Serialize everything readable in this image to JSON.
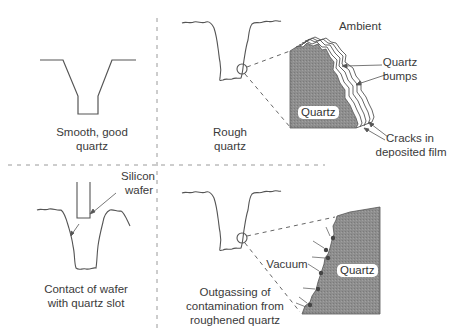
{
  "figure": {
    "panels": [
      {
        "id": "smooth",
        "caption_line1": "Smooth, good",
        "caption_line2": "quartz"
      },
      {
        "id": "rough",
        "caption_line1": "Rough",
        "caption_line2": "quartz",
        "detail": {
          "ambient_label": "Ambient",
          "bumps_label_line1": "Quartz",
          "bumps_label_line2": "bumps",
          "cracks_label_line1": "Cracks in",
          "cracks_label_line2": "deposited film",
          "material_label": "Quartz"
        }
      },
      {
        "id": "contact",
        "caption_line1": "Contact of wafer",
        "caption_line2": "with quartz slot",
        "wafer_label_line1": "Silicon",
        "wafer_label_line2": "wafer"
      },
      {
        "id": "outgassing",
        "caption_line1": "Outgassing of",
        "caption_line2": "contamination from",
        "caption_line3": "roughened quartz",
        "detail": {
          "vacuum_label": "Vacuum",
          "material_label": "Quartz"
        }
      }
    ],
    "colors": {
      "line": "#555555",
      "quartz_fill": "#8c8c8c",
      "divider": "#9a9a9a",
      "contaminant": "#444444"
    }
  }
}
